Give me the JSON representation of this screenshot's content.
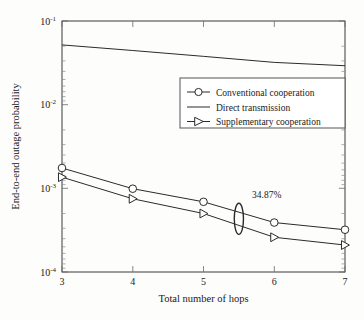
{
  "chart_data": {
    "type": "line",
    "title": "",
    "xlabel": "Total number of hops",
    "ylabel": "End-to-end outage probability",
    "xlim": [
      3,
      7
    ],
    "ylim": [
      0.0001,
      0.1
    ],
    "yscale": "log",
    "xticks": [
      "3",
      "4",
      "5",
      "6",
      "7"
    ],
    "yticks": [
      "10⁻¹",
      "10⁻²",
      "10⁻³",
      "10⁻⁴"
    ],
    "ytick_base": "10",
    "ytick_exponents": [
      "-1",
      "-2",
      "-3",
      "-4"
    ],
    "grid": false,
    "legend_position": "upper-right-inside",
    "x": [
      3,
      4,
      5,
      6,
      7
    ],
    "series": [
      {
        "name": "Conventional cooperation",
        "marker": "circle-open",
        "values": [
          0.00175,
          0.00099,
          0.00069,
          0.00039,
          0.00032
        ]
      },
      {
        "name": "Direct transmission",
        "marker": "none",
        "values": [
          0.0518,
          0.0444,
          0.0378,
          0.032,
          0.0292
        ]
      },
      {
        "name": "Supplementary cooperation",
        "marker": "triangle-right-open",
        "values": [
          0.00136,
          0.00075,
          0.0005,
          0.00026,
          0.00021
        ]
      }
    ],
    "annotations": [
      {
        "text": "34.87%",
        "x": 5.5,
        "shape": "vertical-ellipse",
        "marks": "gap between conventional and supplementary cooperation at 5.5 hops"
      }
    ]
  },
  "legend": {
    "entries": [
      {
        "label": "Conventional cooperation",
        "marker": "circle-open"
      },
      {
        "label": "Direct transmission",
        "marker": "none"
      },
      {
        "label": "Supplementary cooperation",
        "marker": "triangle-right-open"
      }
    ]
  },
  "colors": {
    "line": "#2b2b2b",
    "axis": "#3a3a3a",
    "background": "#fdfdfc",
    "marker_fill": "#ffffff"
  }
}
